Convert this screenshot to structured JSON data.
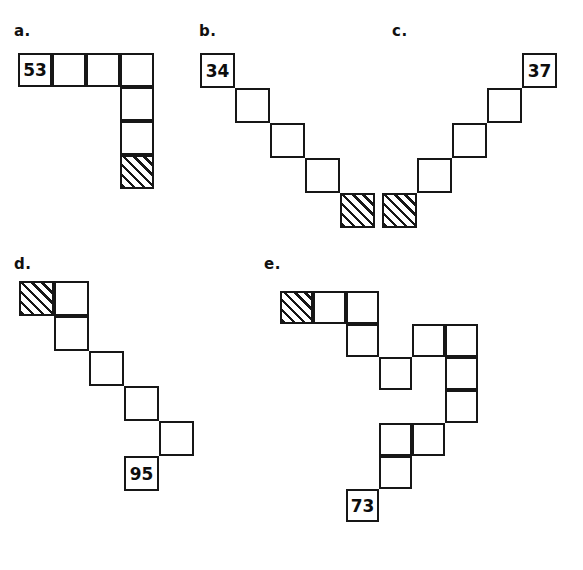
{
  "figure": {
    "cell_size": 34,
    "stroke_color": "#171717",
    "background_color": "#ffffff",
    "hatch_pattern": "diagonal-45-degree-lines",
    "panels": [
      {
        "id": "a",
        "label": "a.",
        "label_x": 14,
        "label_y": 24,
        "origin_x": 18,
        "origin_y": 53,
        "cell_size": 34,
        "cells": [
          {
            "col": 0,
            "row": 0,
            "fill": "white",
            "value": "53"
          },
          {
            "col": 1,
            "row": 0,
            "fill": "white",
            "value": ""
          },
          {
            "col": 2,
            "row": 0,
            "fill": "white",
            "value": ""
          },
          {
            "col": 3,
            "row": 0,
            "fill": "white",
            "value": ""
          },
          {
            "col": 3,
            "row": 1,
            "fill": "white",
            "value": ""
          },
          {
            "col": 3,
            "row": 2,
            "fill": "white",
            "value": ""
          },
          {
            "col": 3,
            "row": 3,
            "fill": "hatched",
            "value": ""
          }
        ]
      },
      {
        "id": "b",
        "label": "b.",
        "label_x": 199,
        "label_y": 24,
        "origin_x": 200,
        "origin_y": 53,
        "cell_size": 35,
        "cells": [
          {
            "col": 0,
            "row": 0,
            "fill": "white",
            "value": "34"
          },
          {
            "col": 1,
            "row": 1,
            "fill": "white",
            "value": ""
          },
          {
            "col": 2,
            "row": 2,
            "fill": "white",
            "value": ""
          },
          {
            "col": 3,
            "row": 3,
            "fill": "white",
            "value": ""
          },
          {
            "col": 4,
            "row": 4,
            "fill": "hatched",
            "value": ""
          }
        ]
      },
      {
        "id": "c",
        "label": "c.",
        "label_x": 392,
        "label_y": 24,
        "origin_x": 382,
        "origin_y": 53,
        "cell_size": 35,
        "cells": [
          {
            "col": 4,
            "row": 0,
            "fill": "white",
            "value": "37"
          },
          {
            "col": 3,
            "row": 1,
            "fill": "white",
            "value": ""
          },
          {
            "col": 2,
            "row": 2,
            "fill": "white",
            "value": ""
          },
          {
            "col": 1,
            "row": 3,
            "fill": "white",
            "value": ""
          },
          {
            "col": 0,
            "row": 4,
            "fill": "hatched",
            "value": ""
          }
        ]
      },
      {
        "id": "d",
        "label": "d.",
        "label_x": 14,
        "label_y": 257,
        "origin_x": 19,
        "origin_y": 281,
        "cell_size": 35,
        "cells": [
          {
            "col": 0,
            "row": 0,
            "fill": "hatched",
            "value": ""
          },
          {
            "col": 1,
            "row": 0,
            "fill": "white",
            "value": ""
          },
          {
            "col": 1,
            "row": 1,
            "fill": "white",
            "value": ""
          },
          {
            "col": 2,
            "row": 2,
            "fill": "white",
            "value": ""
          },
          {
            "col": 3,
            "row": 3,
            "fill": "white",
            "value": ""
          },
          {
            "col": 4,
            "row": 4,
            "fill": "white",
            "value": ""
          },
          {
            "col": 3,
            "row": 5,
            "fill": "white",
            "value": "95"
          }
        ]
      },
      {
        "id": "e",
        "label": "e.",
        "label_x": 264,
        "label_y": 257,
        "origin_x": 280,
        "origin_y": 291,
        "cell_size": 33,
        "cells": [
          {
            "col": 0,
            "row": 0,
            "fill": "hatched",
            "value": ""
          },
          {
            "col": 1,
            "row": 0,
            "fill": "white",
            "value": ""
          },
          {
            "col": 2,
            "row": 0,
            "fill": "white",
            "value": ""
          },
          {
            "col": 2,
            "row": 1,
            "fill": "white",
            "value": ""
          },
          {
            "col": 4,
            "row": 1,
            "fill": "white",
            "value": ""
          },
          {
            "col": 5,
            "row": 1,
            "fill": "white",
            "value": ""
          },
          {
            "col": 3,
            "row": 2,
            "fill": "white",
            "value": ""
          },
          {
            "col": 5,
            "row": 2,
            "fill": "white",
            "value": ""
          },
          {
            "col": 5,
            "row": 3,
            "fill": "white",
            "value": ""
          },
          {
            "col": 3,
            "row": 4,
            "fill": "white",
            "value": ""
          },
          {
            "col": 4,
            "row": 4,
            "fill": "white",
            "value": ""
          },
          {
            "col": 3,
            "row": 5,
            "fill": "white",
            "value": ""
          },
          {
            "col": 2,
            "row": 6,
            "fill": "white",
            "value": "73"
          }
        ]
      }
    ]
  }
}
